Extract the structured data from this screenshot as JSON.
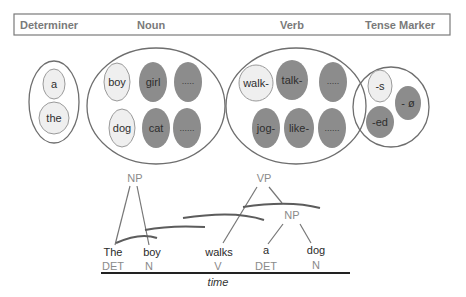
{
  "header": {
    "labels": [
      "Determiner",
      "Noun",
      "Verb",
      "Tense Marker"
    ]
  },
  "colors": {
    "light_fill": "#efefef",
    "dark_fill": "#8c8c8c",
    "outline": "#6e6e6e",
    "header_text": "#7a7a7a",
    "tree_line": "#777777",
    "arc_line": "#5c5c5c"
  },
  "groups": {
    "determiner": {
      "items": [
        {
          "text": "a",
          "shade": "light"
        },
        {
          "text": "the",
          "shade": "light"
        }
      ]
    },
    "noun": {
      "items": [
        {
          "text": "boy",
          "shade": "light"
        },
        {
          "text": "girl",
          "shade": "dark"
        },
        {
          "text": ".....",
          "shade": "dark"
        },
        {
          "text": "dog",
          "shade": "light"
        },
        {
          "text": "cat",
          "shade": "dark"
        },
        {
          "text": "......",
          "shade": "dark"
        }
      ]
    },
    "verb": {
      "items": [
        {
          "text": "walk-",
          "shade": "light"
        },
        {
          "text": "talk-",
          "shade": "dark"
        },
        {
          "text": ".....",
          "shade": "dark"
        },
        {
          "text": "jog-",
          "shade": "dark"
        },
        {
          "text": "like-",
          "shade": "dark"
        },
        {
          "text": "......",
          "shade": "dark"
        }
      ]
    },
    "tense_marker": {
      "items": [
        {
          "text": "-s",
          "shade": "light"
        },
        {
          "text": "- ø",
          "shade": "dark"
        },
        {
          "text": "-ed",
          "shade": "dark"
        }
      ]
    }
  },
  "tree": {
    "nodes": {
      "np1": "NP",
      "vp": "VP",
      "np2": "NP"
    },
    "tokens": [
      {
        "word": "The",
        "pos": "DET"
      },
      {
        "word": "boy",
        "pos": "N"
      },
      {
        "word": "walks",
        "pos": "V"
      },
      {
        "word": "a",
        "pos": "DET"
      },
      {
        "word": "dog",
        "pos": "N"
      }
    ],
    "axis_label": "time"
  }
}
